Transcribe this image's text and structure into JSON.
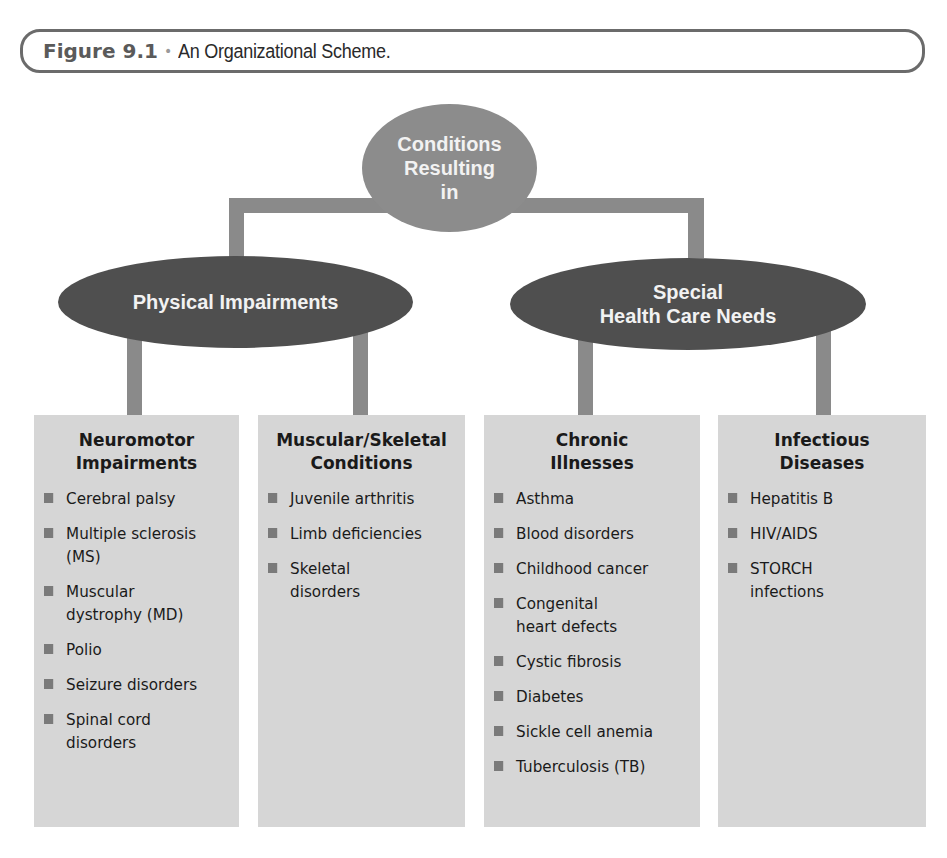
{
  "caption": {
    "figure_label": "Figure 9.1",
    "separator": "•",
    "title": "An Organizational Scheme."
  },
  "root": {
    "label": "Conditions\nResulting\nin"
  },
  "categories": [
    {
      "label": "Physical Impairments"
    },
    {
      "label": "Special\nHealth Care Needs"
    }
  ],
  "boxes": [
    {
      "heading": "Neuromotor\nImpairments",
      "items": [
        "Cerebral palsy",
        "Multiple sclerosis\n(MS)",
        "Muscular\ndystrophy (MD)",
        "Polio",
        "Seizure disorders",
        "Spinal cord\ndisorders"
      ]
    },
    {
      "heading": "Muscular/Skeletal\nConditions",
      "items": [
        "Juvenile arthritis",
        "Limb deficiencies",
        "Skeletal\ndisorders"
      ]
    },
    {
      "heading": "Chronic\nIllnesses",
      "items": [
        "Asthma",
        "Blood disorders",
        "Childhood cancer",
        "Congenital\nheart defects",
        "Cystic fibrosis",
        "Diabetes",
        "Sickle cell anemia",
        "Tuberculosis (TB)"
      ]
    },
    {
      "heading": "Infectious\nDiseases",
      "items": [
        "Hepatitis B",
        "HIV/AIDS",
        "STORCH\ninfections"
      ]
    }
  ],
  "colors": {
    "connector": "#8a8a8a",
    "root_oval": "#8c8c8c",
    "category_oval": "#4f4f4f",
    "box_fill": "#d6d6d6",
    "bullet": "#7a7a7a"
  }
}
